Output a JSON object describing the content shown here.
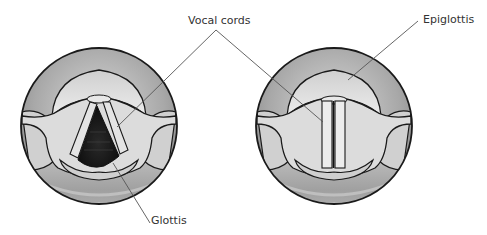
{
  "diagram": {
    "left_view": {
      "state": "open",
      "labels": [
        "Vocal cords",
        "Glottis"
      ]
    },
    "right_view": {
      "state": "closed",
      "labels": [
        "Vocal cords",
        "Epiglottis"
      ]
    }
  },
  "labels": {
    "vocal_cords": "Vocal cords",
    "glottis": "Glottis",
    "epiglottis": "Epiglottis"
  },
  "colors": {
    "outline": "#1a1a1a",
    "tissue_light": "#e6e6e6",
    "tissue_mid": "#b8b8b8",
    "tissue_dark": "#8f8f8f",
    "glottis_opening": "#151515",
    "leader_line": "#555555"
  }
}
